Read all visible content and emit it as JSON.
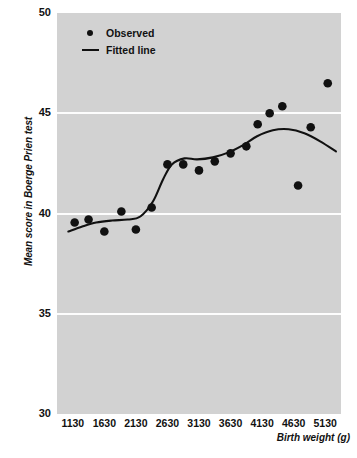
{
  "chart_data": {
    "type": "scatter",
    "title": "",
    "xlabel": "Birth weight (g)",
    "ylabel": "Mean score in Boerge Prien test",
    "xlim": [
      880,
      5380
    ],
    "ylim": [
      30,
      50
    ],
    "xticks": [
      1130,
      1630,
      2130,
      2630,
      3130,
      3630,
      4130,
      4630,
      5130
    ],
    "yticks": [
      30,
      35,
      40,
      45,
      50
    ],
    "grid": "horizontal-white",
    "legend_position": "top-left",
    "legend": [
      {
        "label": "Observed",
        "marker": "filled-circle",
        "color": "#111111"
      },
      {
        "label": "Fitted line",
        "marker": "line",
        "color": "#111111"
      }
    ],
    "series": [
      {
        "name": "Observed",
        "type": "scatter",
        "marker": "filled-circle",
        "color": "#111111",
        "points": [
          {
            "x": 1160,
            "y": 39.55
          },
          {
            "x": 1380,
            "y": 39.7
          },
          {
            "x": 1630,
            "y": 39.1
          },
          {
            "x": 1900,
            "y": 40.1
          },
          {
            "x": 2130,
            "y": 39.2
          },
          {
            "x": 2380,
            "y": 40.3
          },
          {
            "x": 2630,
            "y": 42.45
          },
          {
            "x": 2880,
            "y": 42.45
          },
          {
            "x": 3130,
            "y": 42.15
          },
          {
            "x": 3380,
            "y": 42.6
          },
          {
            "x": 3630,
            "y": 43.0
          },
          {
            "x": 3880,
            "y": 43.35
          },
          {
            "x": 4060,
            "y": 44.45
          },
          {
            "x": 4250,
            "y": 45.0
          },
          {
            "x": 4450,
            "y": 45.35
          },
          {
            "x": 4700,
            "y": 41.4
          },
          {
            "x": 4900,
            "y": 44.3
          },
          {
            "x": 5170,
            "y": 46.5
          }
        ]
      },
      {
        "name": "Fitted line",
        "type": "line",
        "color": "#111111",
        "points": [
          {
            "x": 1060,
            "y": 39.1
          },
          {
            "x": 1280,
            "y": 39.35
          },
          {
            "x": 1500,
            "y": 39.55
          },
          {
            "x": 1750,
            "y": 39.65
          },
          {
            "x": 2000,
            "y": 39.7
          },
          {
            "x": 2200,
            "y": 39.85
          },
          {
            "x": 2400,
            "y": 40.6
          },
          {
            "x": 2560,
            "y": 41.7
          },
          {
            "x": 2700,
            "y": 42.45
          },
          {
            "x": 2900,
            "y": 42.75
          },
          {
            "x": 3100,
            "y": 42.7
          },
          {
            "x": 3350,
            "y": 42.8
          },
          {
            "x": 3600,
            "y": 43.05
          },
          {
            "x": 3850,
            "y": 43.45
          },
          {
            "x": 4050,
            "y": 43.85
          },
          {
            "x": 4300,
            "y": 44.15
          },
          {
            "x": 4550,
            "y": 44.2
          },
          {
            "x": 4800,
            "y": 44.0
          },
          {
            "x": 5050,
            "y": 43.6
          },
          {
            "x": 5300,
            "y": 43.1
          }
        ]
      }
    ]
  }
}
